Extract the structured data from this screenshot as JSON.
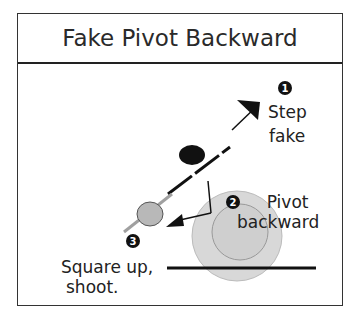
{
  "title": "Fake Pivot Backward",
  "steps": [
    {
      "number": "1",
      "label_line1": "Step",
      "label_line2": "fake"
    },
    {
      "number": "2",
      "label_line1": "Pivot",
      "label_line2": "backward"
    },
    {
      "number": "3",
      "label_line1": "Square up,",
      "label_line2": "shoot."
    }
  ],
  "colors": {
    "defender_circle_outer": "#d6d6d6",
    "defender_circle_inner": "#cfcfcf",
    "player_circle": "#b5b5b5",
    "dark": "#111111",
    "gray_line": "#a0a0a0"
  }
}
